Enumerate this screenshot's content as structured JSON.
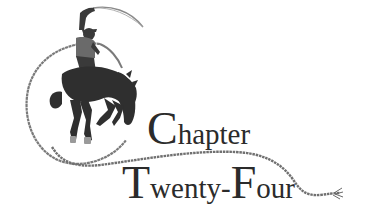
{
  "heading": {
    "line1": {
      "initial": "C",
      "rest": "hapter"
    },
    "line2": {
      "part1_initial": "T",
      "part1_rest": "wenty-",
      "part2_initial": "F",
      "part2_rest": "our"
    }
  },
  "illustration": {
    "subject": "cowboy riding a bucking bronco, swinging a lasso",
    "icons": [
      "bronco-rider-icon",
      "lasso-rope-icon"
    ]
  },
  "colors": {
    "background": "#ffffff",
    "text": "#2b2b2b",
    "silhouette": "#2f2f2f",
    "rope": "#7a7a7a"
  }
}
